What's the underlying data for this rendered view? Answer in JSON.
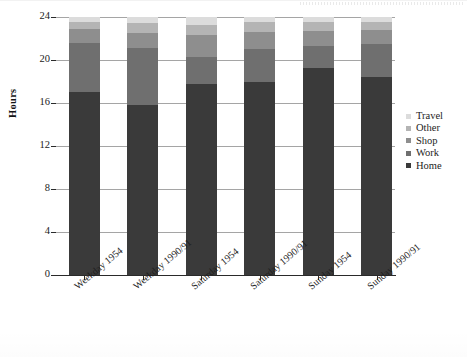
{
  "chart_data": {
    "type": "bar",
    "subtype": "stacked",
    "title": "",
    "xlabel": "",
    "ylabel": "Hours",
    "ylim": [
      0,
      24
    ],
    "yticks": [
      0,
      4,
      8,
      12,
      16,
      20,
      24
    ],
    "grid": true,
    "legend_position": "right",
    "categories": [
      "Weekday 1954",
      "Weekday 1990/91",
      "Saturday 1954",
      "Saturday 1990/91",
      "Sunday 1954",
      "Sunday 1990/91"
    ],
    "series": [
      {
        "name": "Home",
        "color": "#3a3a3a",
        "values": [
          17.0,
          15.8,
          17.8,
          18.0,
          19.3,
          18.4
        ]
      },
      {
        "name": "Work",
        "color": "#6f6f6f",
        "values": [
          4.6,
          5.3,
          2.5,
          3.0,
          2.0,
          3.1
        ]
      },
      {
        "name": "Shop",
        "color": "#8e8e8e",
        "values": [
          1.3,
          1.4,
          2.0,
          1.6,
          1.4,
          1.3
        ]
      },
      {
        "name": "Other",
        "color": "#b4b4b4",
        "values": [
          0.6,
          0.9,
          1.0,
          0.9,
          0.8,
          0.7
        ]
      },
      {
        "name": "Travel",
        "color": "#dcdcdc",
        "values": [
          0.5,
          0.6,
          0.7,
          0.5,
          0.5,
          0.5
        ]
      }
    ],
    "stack_order_bottom_to_top": [
      "Home",
      "Work",
      "Shop",
      "Other",
      "Travel"
    ],
    "legend_order_top_to_bottom": [
      "Travel",
      "Other",
      "Shop",
      "Work",
      "Home"
    ],
    "bar_total": 24
  }
}
